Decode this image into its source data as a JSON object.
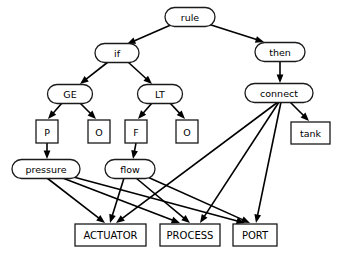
{
  "diagram": {
    "canvas": {
      "width": 340,
      "height": 258
    },
    "colors": {
      "background": "#ffffff",
      "stroke": "#1a1a1a",
      "edge": "#000000",
      "text": "#000000"
    },
    "nodes": [
      {
        "id": "rule",
        "label": "rule",
        "shape": "ellipse",
        "cx": 190,
        "cy": 17,
        "rx": 25,
        "ry": 9.5,
        "font": 9.5
      },
      {
        "id": "if",
        "label": "if",
        "shape": "ellipse",
        "cx": 117,
        "cy": 53,
        "rx": 22,
        "ry": 9.5,
        "font": 9.5
      },
      {
        "id": "then",
        "label": "then",
        "shape": "ellipse",
        "cx": 280,
        "cy": 52,
        "rx": 25,
        "ry": 9.5,
        "font": 9.5
      },
      {
        "id": "ge",
        "label": "GE",
        "shape": "ellipse",
        "cx": 70,
        "cy": 94,
        "rx": 22.5,
        "ry": 9.5,
        "font": 9.5
      },
      {
        "id": "lt",
        "label": "LT",
        "shape": "ellipse",
        "cx": 160,
        "cy": 94,
        "rx": 22.5,
        "ry": 9.5,
        "font": 9.5
      },
      {
        "id": "connect",
        "label": "connect",
        "shape": "ellipse",
        "cx": 279,
        "cy": 93,
        "rx": 34,
        "ry": 9.5,
        "font": 9.5
      },
      {
        "id": "p",
        "label": "P",
        "shape": "rect",
        "x": 36,
        "y": 120,
        "w": 22,
        "h": 23,
        "font": 9.5
      },
      {
        "id": "o1",
        "label": "O",
        "shape": "rect",
        "x": 88,
        "y": 120,
        "w": 22,
        "h": 23,
        "font": 9.5
      },
      {
        "id": "f",
        "label": "F",
        "shape": "rect",
        "x": 125,
        "y": 120,
        "w": 22,
        "h": 23,
        "font": 9.5
      },
      {
        "id": "o2",
        "label": "O",
        "shape": "rect",
        "x": 176,
        "y": 120,
        "w": 22,
        "h": 23,
        "font": 9.5
      },
      {
        "id": "tank",
        "label": "tank",
        "shape": "rect",
        "x": 291,
        "y": 122,
        "w": 39,
        "h": 22,
        "font": 9.5
      },
      {
        "id": "pressure",
        "label": "pressure",
        "shape": "ellipse",
        "cx": 46,
        "cy": 169,
        "rx": 34,
        "ry": 9.5,
        "font": 9.5
      },
      {
        "id": "flow",
        "label": "flow",
        "shape": "ellipse",
        "cx": 130,
        "cy": 169,
        "rx": 25,
        "ry": 9.5,
        "font": 9.5
      },
      {
        "id": "actuator",
        "label": "ACTUATOR",
        "shape": "rect",
        "x": 75,
        "y": 224,
        "w": 71,
        "h": 22,
        "font": 10
      },
      {
        "id": "process",
        "label": "PROCESS",
        "shape": "rect",
        "x": 160,
        "y": 224,
        "w": 60,
        "h": 22,
        "font": 10
      },
      {
        "id": "port",
        "label": "PORT",
        "shape": "rect",
        "x": 233,
        "y": 224,
        "w": 44,
        "h": 22,
        "font": 10
      }
    ],
    "edges": [
      {
        "from": "rule",
        "to": "if",
        "x1": 173,
        "y1": 24,
        "x2": 127,
        "y2": 44
      },
      {
        "from": "rule",
        "to": "then",
        "x1": 208,
        "y1": 24,
        "x2": 264,
        "y2": 42
      },
      {
        "from": "if",
        "to": "ge",
        "x1": 108,
        "y1": 62,
        "x2": 80,
        "y2": 84
      },
      {
        "from": "if",
        "to": "lt",
        "x1": 128,
        "y1": 62,
        "x2": 152,
        "y2": 84
      },
      {
        "from": "then",
        "to": "connect",
        "x1": 280,
        "y1": 62,
        "x2": 280,
        "y2": 83
      },
      {
        "from": "ge",
        "to": "p",
        "x1": 62,
        "y1": 103,
        "x2": 48,
        "y2": 119
      },
      {
        "from": "ge",
        "to": "o1",
        "x1": 80,
        "y1": 103,
        "x2": 96,
        "y2": 119
      },
      {
        "from": "lt",
        "to": "f",
        "x1": 152,
        "y1": 103,
        "x2": 138,
        "y2": 119
      },
      {
        "from": "lt",
        "to": "o2",
        "x1": 170,
        "y1": 103,
        "x2": 185,
        "y2": 119
      },
      {
        "from": "p",
        "to": "pressure",
        "x1": 47,
        "y1": 143,
        "x2": 47,
        "y2": 159
      },
      {
        "from": "f",
        "to": "flow",
        "x1": 136,
        "y1": 143,
        "x2": 133,
        "y2": 159
      },
      {
        "from": "connect",
        "to": "tank",
        "x1": 290,
        "y1": 102,
        "x2": 309,
        "y2": 121
      },
      {
        "from": "connect",
        "to": "actuator",
        "x1": 278,
        "y1": 102,
        "x2": 116,
        "y2": 223
      },
      {
        "from": "connect",
        "to": "process",
        "x1": 279,
        "y1": 102,
        "x2": 200,
        "y2": 223
      },
      {
        "from": "connect",
        "to": "port",
        "x1": 281,
        "y1": 102,
        "x2": 256,
        "y2": 223
      },
      {
        "from": "pressure",
        "to": "actuator",
        "x1": 47,
        "y1": 178,
        "x2": 105,
        "y2": 223
      },
      {
        "from": "pressure",
        "to": "process",
        "x1": 60,
        "y1": 177,
        "x2": 180,
        "y2": 223
      },
      {
        "from": "pressure",
        "to": "port",
        "x1": 66,
        "y1": 175,
        "x2": 245,
        "y2": 223
      },
      {
        "from": "flow",
        "to": "actuator",
        "x1": 124,
        "y1": 178,
        "x2": 110,
        "y2": 223
      },
      {
        "from": "flow",
        "to": "process",
        "x1": 136,
        "y1": 178,
        "x2": 190,
        "y2": 223
      },
      {
        "from": "flow",
        "to": "port",
        "x1": 143,
        "y1": 175,
        "x2": 250,
        "y2": 223
      }
    ]
  }
}
